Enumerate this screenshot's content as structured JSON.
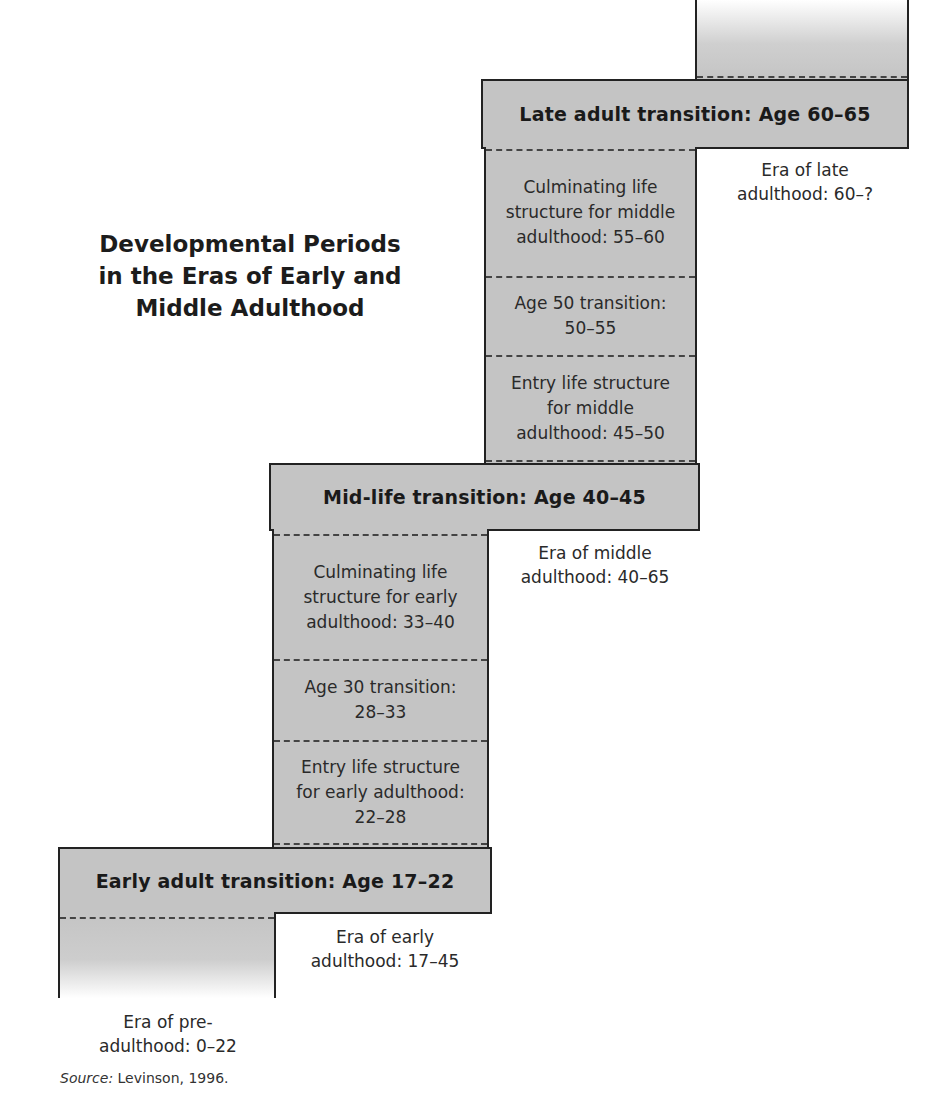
{
  "title": {
    "line1": "Developmental Periods",
    "line2": "in the Eras of Early and",
    "line3": "Middle Adulthood"
  },
  "transitions": {
    "late": "Late adult transition:  Age 60–65",
    "midlife": "Mid-life transition:  Age 40–45",
    "early": "Early adult transition:  Age 17–22"
  },
  "middle_column": [
    {
      "lines": [
        "Culminating life",
        "structure for middle",
        "adulthood:  55–60"
      ]
    },
    {
      "lines": [
        "Age 50 transition:",
        "50–55"
      ]
    },
    {
      "lines": [
        "Entry life structure",
        "for middle",
        "adulthood:  45–50"
      ]
    }
  ],
  "early_column": [
    {
      "lines": [
        "Culminating life",
        "structure for early",
        "adulthood:  33–40"
      ]
    },
    {
      "lines": [
        "Age 30 transition:",
        "28–33"
      ]
    },
    {
      "lines": [
        "Entry life structure",
        "for early adulthood:",
        "22–28"
      ]
    }
  ],
  "eras": {
    "late": {
      "line1": "Era of late",
      "line2": "adulthood:  60–?"
    },
    "middle": {
      "line1": "Era of middle",
      "line2": "adulthood:  40–65"
    },
    "early": {
      "line1": "Era of early",
      "line2": "adulthood:  17–45"
    },
    "pre": {
      "line1": "Era of pre-",
      "line2": "adulthood:  0–22"
    }
  },
  "source": {
    "label": "Source:",
    "text": " Levinson, 1996."
  },
  "colors": {
    "fill": "#c4c4c4",
    "stroke": "#222222"
  }
}
